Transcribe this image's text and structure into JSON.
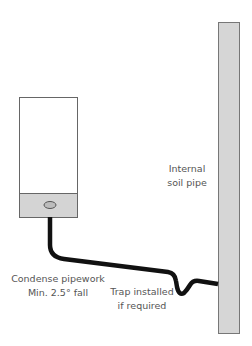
{
  "diagram": {
    "components": {
      "boiler": {
        "body_color": "#ffffff",
        "base_color": "#d4d4d4",
        "outline_color": "#666666"
      },
      "soil_pipe": {
        "fill_color": "#d6d6d6",
        "outline_color": "#777777"
      },
      "condense_pipe": {
        "color": "#111111"
      }
    },
    "labels": {
      "soil_pipe_line1": "Internal",
      "soil_pipe_line2": "soil pipe",
      "pipework_line1": "Condense pipework",
      "pipework_line2": "Min. 2.5° fall",
      "trap_line1": "Trap installed",
      "trap_line2": "if required"
    }
  }
}
